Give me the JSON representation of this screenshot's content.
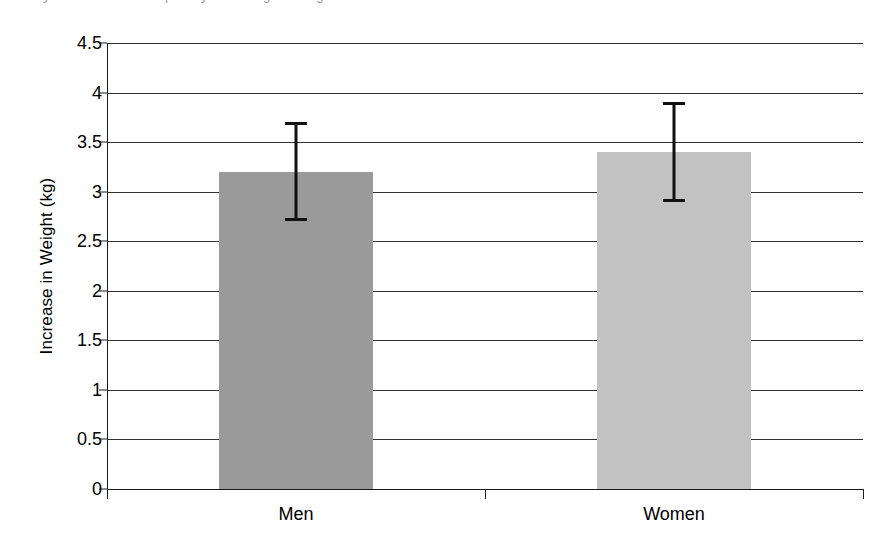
{
  "figure": {
    "caption_sliver": "study has been used to quantify the change in weight",
    "background_color": "#ffffff"
  },
  "chart_data": {
    "type": "bar",
    "title": "",
    "subtitle": "",
    "xlabel": "",
    "ylabel": "Increase in Weight (kg)",
    "categories": [
      "Men",
      "Women"
    ],
    "values": [
      3.2,
      3.4
    ],
    "series": [
      {
        "name": "Increase in Weight",
        "values": [
          3.2,
          3.4
        ],
        "error_low": [
          2.7,
          2.9
        ],
        "error_high": [
          3.7,
          3.9
        ],
        "error_minus": [
          0.5,
          0.5
        ],
        "error_plus": [
          0.5,
          0.5
        ]
      }
    ],
    "bar_colors": [
      "#9a9a9a",
      "#c2c2c2"
    ],
    "errorbar_color": "#111111",
    "ylim": [
      0,
      4.5
    ],
    "ytick_step": 0.5,
    "yticks": [
      0,
      0.5,
      1,
      1.5,
      2,
      2.5,
      3,
      3.5,
      4,
      4.5
    ],
    "ytick_labels": [
      "0",
      "0.5",
      "1",
      "1.5",
      "2",
      "2.5",
      "3",
      "3.5",
      "4",
      "4.5"
    ],
    "grid": true,
    "grid_axis": "y",
    "grid_color": "#2f2f2f",
    "legend": false,
    "legend_position": "none",
    "axis_color": "#1a1a1a",
    "annotations": []
  },
  "axes": {
    "y_title": "Increase in Weight (kg)",
    "x_tick_positions": [
      0,
      0.5,
      1
    ]
  }
}
